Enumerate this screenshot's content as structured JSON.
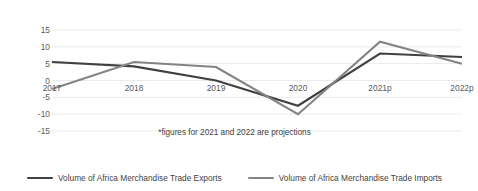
{
  "chart_data": {
    "type": "line",
    "title": "",
    "xlabel": "",
    "ylabel": "Annual % Change",
    "categories": [
      "2017",
      "2018",
      "2019",
      "2020",
      "2021p",
      "2022p"
    ],
    "ylim": [
      -15,
      15
    ],
    "yticks": [
      15,
      10,
      5,
      0,
      -5,
      -10,
      -15
    ],
    "ytick_labels": [
      "15",
      "10",
      "5",
      "0",
      "-5",
      "-10",
      "-15"
    ],
    "grid": true,
    "legend_position": "bottom",
    "annotation": "*figures for 2021 and 2022 are projections",
    "series": [
      {
        "name": "Volume of Africa Merchandise Trade Exports",
        "color": "#404040",
        "values": [
          5.5,
          4.2,
          0.0,
          -7.5,
          8.0,
          7.0
        ]
      },
      {
        "name": "Volume of Africa Merchandise Trade Imports",
        "color": "#848484",
        "values": [
          -2.5,
          5.5,
          4.0,
          -10.0,
          11.5,
          5.0
        ]
      }
    ]
  },
  "axis": {
    "y_title": "Annual % Change"
  },
  "legend": {
    "items": [
      {
        "label": "Volume of Africa Merchandise Trade Exports",
        "color": "#404040"
      },
      {
        "label": "Volume of Africa Merchandise Trade Imports",
        "color": "#848484"
      }
    ]
  },
  "footnote": {
    "text": "*figures for 2021 and 2022 are projections"
  }
}
